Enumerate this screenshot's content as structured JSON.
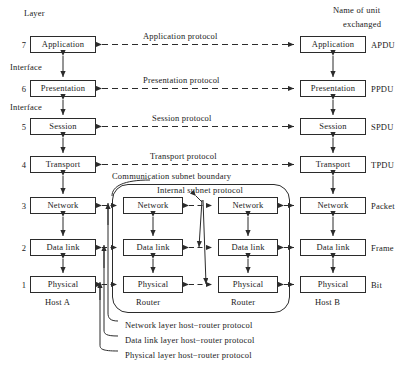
{
  "diagram": {
    "title_left": "Layer",
    "title_right_line1": "Name of unit",
    "title_right_line2": "exchanged",
    "interface_label": "Interface",
    "subnet_boundary_label": "Communication subnet boundary",
    "internal_subnet_label": "Internal subnet protocol",
    "host_a_label": "Host A",
    "host_b_label": "Host B",
    "router_1_label": "Router",
    "router_2_label": "Router"
  },
  "layers": [
    {
      "number": "7",
      "name": "Application",
      "protocol": "Application protocol",
      "unit": "APDU"
    },
    {
      "number": "6",
      "name": "Presentation",
      "protocol": "Presentation protocol",
      "unit": "PPDU"
    },
    {
      "number": "5",
      "name": "Session",
      "protocol": "Session protocol",
      "unit": "SPDU"
    },
    {
      "number": "4",
      "name": "Transport",
      "protocol": "Transport protocol",
      "unit": "TPDU"
    },
    {
      "number": "3",
      "name": "Network",
      "protocol": "",
      "unit": "Packet"
    },
    {
      "number": "2",
      "name": "Data link",
      "protocol": "",
      "unit": "Frame"
    },
    {
      "number": "1",
      "name": "Physical",
      "protocol": "",
      "unit": "Bit"
    }
  ],
  "router_1": {
    "network": "Network",
    "data_link": "Data link",
    "physical": "Physical"
  },
  "router_2": {
    "network": "Network",
    "data_link": "Data link",
    "physical": "Physical"
  },
  "host_router_protocols": [
    "Network layer host−router protocol",
    "Data link layer host−router protocol",
    "Physical layer host−router protocol"
  ],
  "colors": {
    "line": "#2b2b2b",
    "text": "#1a1a1a",
    "background": "#ffffff"
  }
}
